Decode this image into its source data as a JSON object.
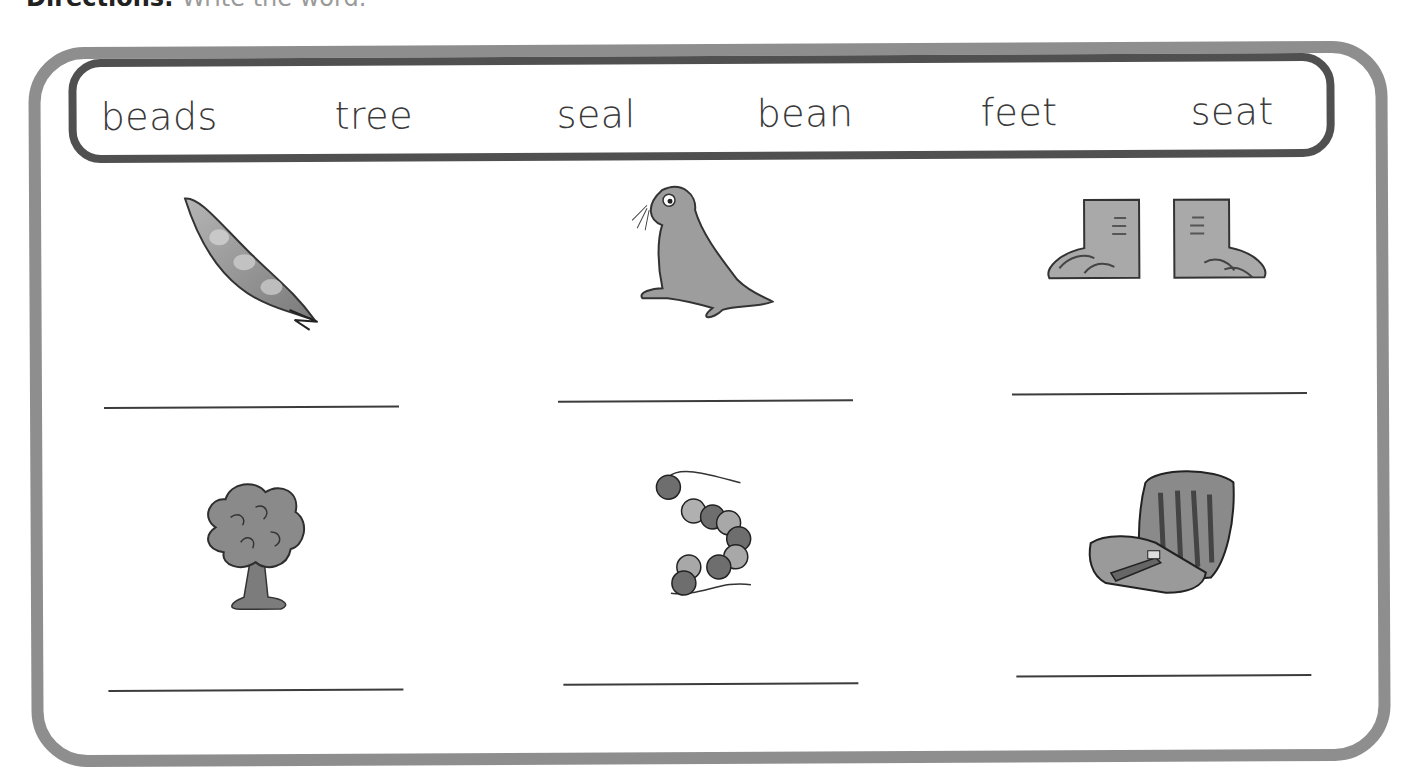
{
  "header": {
    "label": "Directions:",
    "text": "Write the word."
  },
  "word_bank": [
    "beads",
    "tree",
    "seal",
    "bean",
    "feet",
    "seat"
  ],
  "items": [
    {
      "picture": "bean-pod",
      "answer": ""
    },
    {
      "picture": "seal",
      "answer": ""
    },
    {
      "picture": "feet",
      "answer": ""
    },
    {
      "picture": "tree",
      "answer": ""
    },
    {
      "picture": "beads",
      "answer": ""
    },
    {
      "picture": "seat",
      "answer": ""
    }
  ],
  "colors": {
    "outer_border": "#8e8e8e",
    "wordbank_border": "#505050",
    "text": "#3a3a3a"
  }
}
